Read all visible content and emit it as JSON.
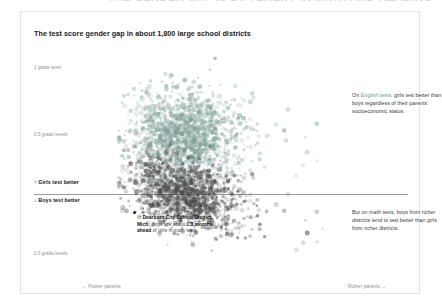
{
  "page": {
    "clipped_headline": "THE GENDER GAP IS DIFFERENT IN MATH AND READING"
  },
  "card": {
    "title": "The test score gender gap in about 1,800 large school districts"
  },
  "axes": {
    "y_ticks": [
      {
        "label": "1 grade level"
      },
      {
        "label": "0.5 grade levels"
      },
      {
        "label": "0.5 grade levels"
      }
    ],
    "direction_up": "↑ Girls test better",
    "direction_down": "↓ Boys test better",
    "x_left": "← Poorer parents",
    "x_right": "Richer parents →"
  },
  "annotations": {
    "english": {
      "prefix": "On ",
      "highlight": "English tests",
      "body": ", girls test better than boys regardless of their parents' socioeconomic status."
    },
    "math": {
      "body": "But on math tests, boys from richer districts tend to test better than girls from richer districts."
    },
    "dearborn": {
      "p1": "In ",
      "b1": "Dearborn City School District, Mich.",
      "p2": ", boys are about ",
      "b2": "1.3 months ahead",
      "p3": " of girls in math tests."
    }
  },
  "colors": {
    "english_points": "#7d9e97",
    "math_points": "#4a4a4a",
    "highlight": "#6f9b8e",
    "zero_line": "#9a9a9a",
    "border": "#e2e2e4"
  },
  "chart_data": {
    "type": "scatter",
    "title": "The test score gender gap in about 1,800 large school districts",
    "xlabel": "Parental socioeconomic status (poorer → richer)",
    "ylabel": "Gender gap in grade levels",
    "ylim": [
      -0.75,
      1.1
    ],
    "xlim": [
      -2.0,
      3.2
    ],
    "grid": false,
    "legend": "none",
    "y_tick_values": [
      1.0,
      0.5,
      0.0,
      -0.5
    ],
    "y_tick_labels": [
      "1 grade level",
      "0.5 grade levels",
      "0",
      "0.5 grade levels"
    ],
    "zero_line": 0,
    "n_points_per_series": 1800,
    "series": [
      {
        "name": "English tests",
        "color": "#7d9e97",
        "description": "Girls ahead of boys at all socioeconomic levels; cloud centered near +0.45 grade levels, roughly flat slope.",
        "trend_intercept": 0.46,
        "trend_slope": -0.02,
        "spread_sd": 0.16
      },
      {
        "name": "Math tests",
        "color": "#4a4a4a",
        "description": "Gap near zero for poorer districts, boys increasingly ahead in richer districts; cloud straddles the zero line.",
        "trend_intercept": -0.02,
        "trend_slope": -0.08,
        "spread_sd": 0.13
      }
    ],
    "highlighted_point": {
      "label": "Dearborn City School District, Mich.",
      "series": "Math tests",
      "value_months": 1.3,
      "direction": "boys ahead"
    }
  }
}
